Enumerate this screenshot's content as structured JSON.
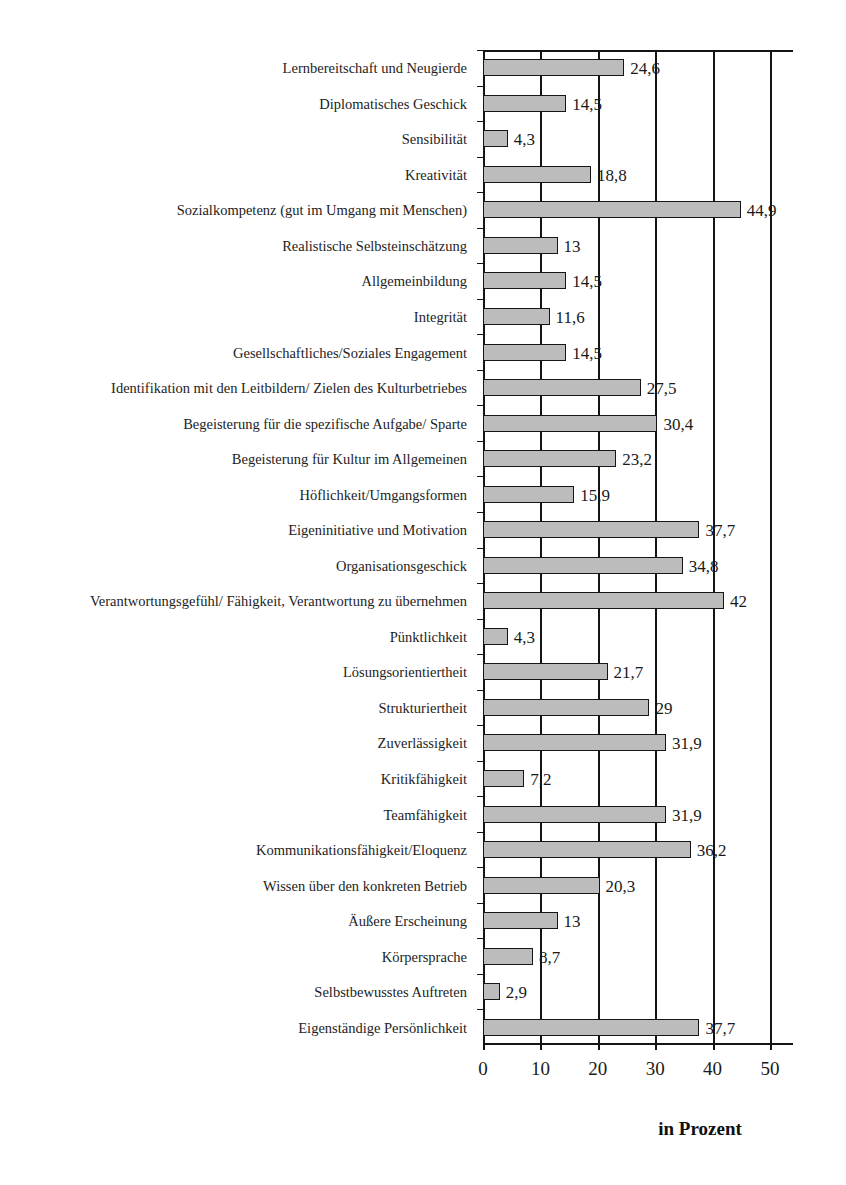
{
  "chart_data": {
    "type": "bar",
    "orientation": "horizontal",
    "title": "",
    "xlabel": "in Prozent",
    "ylabel": "",
    "xlim": [
      0,
      54
    ],
    "grid": true,
    "legend": null,
    "xticks": [
      "0",
      "10",
      "20",
      "30",
      "40",
      "50"
    ],
    "xtick_values": [
      0,
      10,
      20,
      30,
      40,
      50
    ],
    "categories": [
      "Lernbereitschaft und Neugierde",
      "Diplomatisches Geschick",
      "Sensibilität",
      "Kreativität",
      "Sozialkompetenz (gut im Umgang mit Menschen)",
      "Realistische Selbsteinschätzung",
      "Allgemeinbildung",
      "Integrität",
      "Gesellschaftliches/Soziales Engagement",
      "Identifikation mit den Leitbildern/ Zielen des Kulturbetriebes",
      "Begeisterung für die spezifische Aufgabe/ Sparte",
      "Begeisterung für Kultur im Allgemeinen",
      "Höflichkeit/Umgangsformen",
      "Eigeninitiative und Motivation",
      "Organisationsgeschick",
      "Verantwortungsgefühl/ Fähigkeit, Verantwortung zu übernehmen",
      "Pünktlichkeit",
      "Lösungsorientiertheit",
      "Strukturiertheit",
      "Zuverlässigkeit",
      "Kritikfähigkeit",
      "Teamfähigkeit",
      "Kommunikationsfähigkeit/Eloquenz",
      "Wissen über den konkreten Betrieb",
      "Äußere Erscheinung",
      "Körpersprache",
      "Selbstbewusstes Auftreten",
      "Eigenständige Persönlichkeit"
    ],
    "values": [
      24.6,
      14.5,
      4.3,
      18.8,
      44.9,
      13,
      14.5,
      11.6,
      14.5,
      27.5,
      30.4,
      23.2,
      15.9,
      37.7,
      34.8,
      42,
      4.3,
      21.7,
      29,
      31.9,
      7.2,
      31.9,
      36.2,
      20.3,
      13,
      8.7,
      2.9,
      37.7
    ],
    "value_labels": [
      "24,6",
      "14,5",
      "4,3",
      "18,8",
      "44,9",
      "13",
      "14,5",
      "11,6",
      "14,5",
      "27,5",
      "30,4",
      "23,2",
      "15,9",
      "37,7",
      "34,8",
      "42",
      "4,3",
      "21,7",
      "29",
      "31,9",
      "7,2",
      "31,9",
      "36,2",
      "20,3",
      "13",
      "8,7",
      "2,9",
      "37,7"
    ],
    "bar_fill_color": "#bcbcbc",
    "bar_edge_color": "#161616",
    "axis_color": "#141414"
  }
}
